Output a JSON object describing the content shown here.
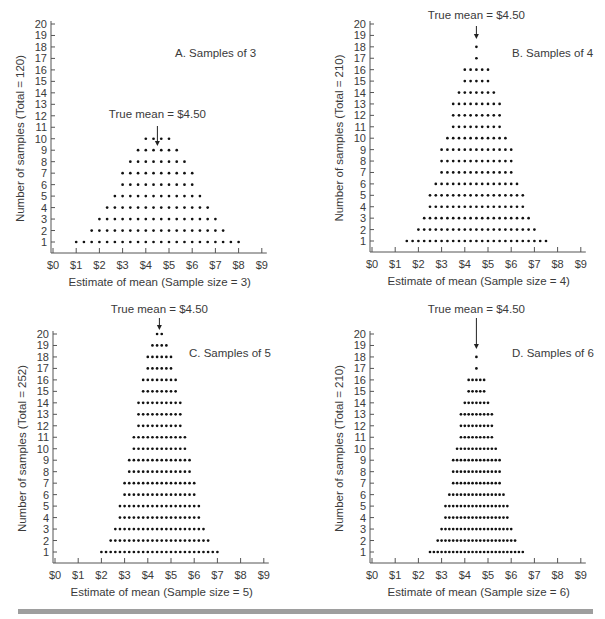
{
  "figure": {
    "bottom_rule_color": "#9e9e9e",
    "dot_color": "#111111",
    "axis_color": "#555555"
  },
  "chart_data": [
    {
      "id": "A",
      "type": "scatter",
      "subtype": "dot-histogram",
      "title": "A. Samples of 3",
      "annotation": "True mean = $4.50",
      "true_mean": 4.5,
      "xlabel": "Estimate of mean (Sample size = 3)",
      "ylabel": "Number of samples (Total = 120)",
      "total": 120,
      "xlim": [
        0,
        9
      ],
      "ylim": [
        0,
        20
      ],
      "x_ticks": [
        "$0",
        "$1",
        "$2",
        "$3",
        "$4",
        "$5",
        "$6",
        "$7",
        "$8",
        "$9"
      ],
      "y_ticks": [
        "1",
        "2",
        "3",
        "4",
        "5",
        "6",
        "7",
        "8",
        "9",
        "10",
        "11",
        "12",
        "13",
        "14",
        "15",
        "16",
        "17",
        "18",
        "19",
        "20"
      ],
      "x_start": 1.0,
      "x_step": 0.3333333,
      "counts": [
        1,
        1,
        2,
        3,
        4,
        5,
        7,
        8,
        9,
        10,
        10,
        10,
        10,
        9,
        8,
        7,
        5,
        4,
        3,
        2,
        1,
        1
      ]
    },
    {
      "id": "B",
      "type": "scatter",
      "subtype": "dot-histogram",
      "title": "B. Samples of 4",
      "annotation": "True mean = $4.50",
      "true_mean": 4.5,
      "xlabel": "Estimate of mean (Sample size = 4)",
      "ylabel": "Number of samples (Total = 210)",
      "total": 210,
      "xlim": [
        0,
        9
      ],
      "ylim": [
        0,
        20
      ],
      "x_ticks": [
        "$0",
        "$1",
        "$2",
        "$3",
        "$4",
        "$5",
        "$6",
        "$7",
        "$8",
        "$9"
      ],
      "y_ticks": [
        "1",
        "2",
        "3",
        "4",
        "5",
        "6",
        "7",
        "8",
        "9",
        "10",
        "11",
        "12",
        "13",
        "14",
        "15",
        "16",
        "17",
        "18",
        "19",
        "20"
      ],
      "x_start": 1.5,
      "x_step": 0.25,
      "counts": [
        1,
        1,
        2,
        3,
        5,
        6,
        9,
        10,
        13,
        14,
        16,
        16,
        18,
        16,
        16,
        14,
        13,
        10,
        9,
        6,
        5,
        3,
        2,
        1,
        1
      ]
    },
    {
      "id": "C",
      "type": "scatter",
      "subtype": "dot-histogram",
      "title": "C. Samples of 5",
      "annotation": "True mean = $4.50",
      "true_mean": 4.5,
      "xlabel": "Estimate of mean (Sample size = 5)",
      "ylabel": "Number of samples (Total = 252)",
      "total": 252,
      "xlim": [
        0,
        9
      ],
      "ylim": [
        0,
        20
      ],
      "x_ticks": [
        "$0",
        "$1",
        "$2",
        "$3",
        "$4",
        "$5",
        "$6",
        "$7",
        "$8",
        "$9"
      ],
      "y_ticks": [
        "1",
        "2",
        "3",
        "4",
        "5",
        "6",
        "7",
        "8",
        "9",
        "10",
        "11",
        "12",
        "13",
        "14",
        "15",
        "16",
        "17",
        "18",
        "19",
        "20"
      ],
      "x_start": 2.0,
      "x_step": 0.2,
      "counts": [
        1,
        1,
        2,
        3,
        5,
        7,
        9,
        11,
        14,
        16,
        18,
        19,
        20,
        20,
        19,
        18,
        16,
        14,
        11,
        9,
        7,
        5,
        3,
        2,
        1,
        1
      ]
    },
    {
      "id": "D",
      "type": "scatter",
      "subtype": "dot-histogram",
      "title": "D. Samples of 6",
      "annotation": "True mean = $4.50",
      "true_mean": 4.5,
      "xlabel": "Estimate of mean (Sample size = 6)",
      "ylabel": "Number of samples (Total = 210)",
      "total": 210,
      "xlim": [
        0,
        9
      ],
      "ylim": [
        0,
        20
      ],
      "x_ticks": [
        "$0",
        "$1",
        "$2",
        "$3",
        "$4",
        "$5",
        "$6",
        "$7",
        "$8",
        "$9"
      ],
      "y_ticks": [
        "1",
        "2",
        "3",
        "4",
        "5",
        "6",
        "7",
        "8",
        "9",
        "10",
        "11",
        "12",
        "13",
        "14",
        "15",
        "16",
        "17",
        "18",
        "19",
        "20"
      ],
      "x_start": 2.5,
      "x_step": 0.1666667,
      "counts": [
        1,
        1,
        2,
        3,
        5,
        6,
        9,
        10,
        13,
        14,
        16,
        16,
        18,
        16,
        16,
        14,
        13,
        10,
        9,
        6,
        5,
        3,
        2,
        1,
        1
      ]
    }
  ]
}
